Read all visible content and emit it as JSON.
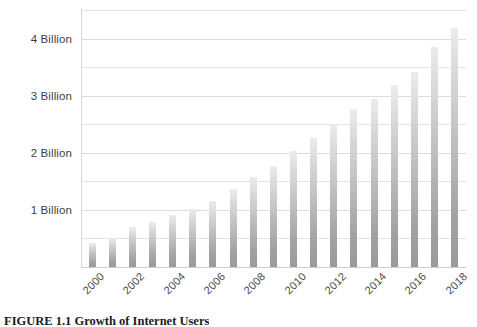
{
  "figure": {
    "caption": "FIGURE 1.1 Growth of Internet Users",
    "background_color": "#ffffff"
  },
  "chart_data": {
    "type": "bar",
    "title": "",
    "subtitle": "",
    "xlabel": "",
    "ylabel": "",
    "categories": [
      "2000",
      "2001",
      "2002",
      "2003",
      "2004",
      "2005",
      "2006",
      "2007",
      "2008",
      "2009",
      "2010",
      "2011",
      "2012",
      "2013",
      "2014",
      "2015",
      "2016",
      "2017",
      "2018"
    ],
    "values": [
      0.42,
      0.51,
      0.7,
      0.78,
      0.91,
      1.02,
      1.16,
      1.37,
      1.57,
      1.77,
      2.03,
      2.26,
      2.5,
      2.76,
      2.95,
      3.18,
      3.42,
      3.85,
      4.19
    ],
    "x_tick_labels": [
      "2000",
      "",
      "2002",
      "",
      "2004",
      "",
      "2006",
      "",
      "2008",
      "",
      "2010",
      "",
      "2012",
      "",
      "2014",
      "",
      "2016",
      "",
      "2018"
    ],
    "y_tick_labels": [
      "1 Billion",
      "2 Billion",
      "3 Billion",
      "4 Billion"
    ],
    "y_tick_values": [
      1,
      2,
      3,
      4
    ],
    "y_minor_tick_values": [
      0.5,
      1.5,
      2.5,
      3.5,
      4.5
    ],
    "ylim": [
      0,
      4.5
    ],
    "grid": true,
    "grid_axis": "y",
    "legend": false,
    "legend_position": "none",
    "x_tick_label_rotation": -45,
    "bar_color_top": "#ececec",
    "bar_color_bottom": "#9a9a9a",
    "gridline_color": "#e3e3e3",
    "axis_color": "#d8d8d8",
    "tick_label_color": "#3f3f3f"
  }
}
